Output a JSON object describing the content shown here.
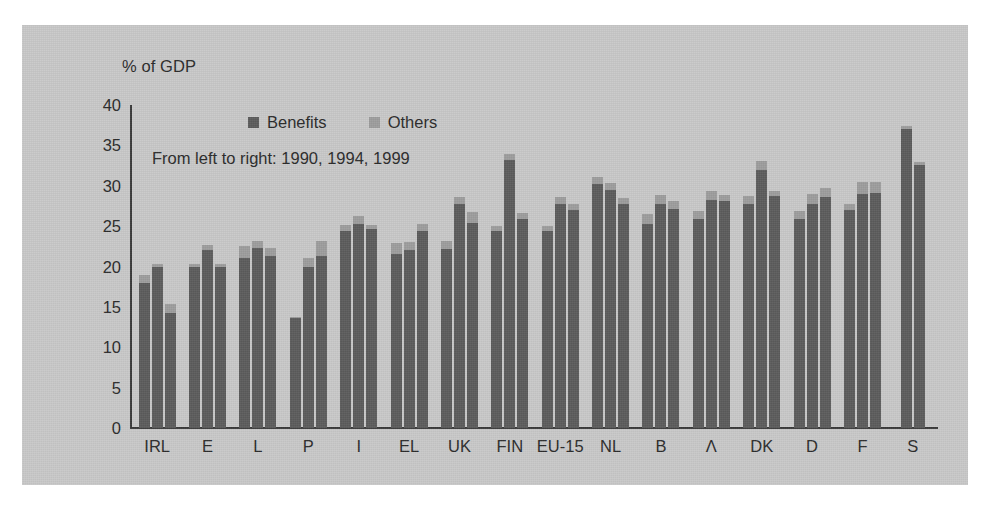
{
  "chart_data": {
    "type": "bar",
    "title": "",
    "subtitle": "",
    "axis_title": "% of GDP",
    "annotation": "From left to right: 1990, 1994, 1999",
    "xlabel": "",
    "ylabel": "% of GDP",
    "ylim": [
      0,
      40
    ],
    "yticks": [
      40,
      35,
      30,
      25,
      20,
      15,
      10,
      5,
      0
    ],
    "grid": false,
    "legend_position": "top-center",
    "stacked": true,
    "legend": [
      {
        "label": "Benefits",
        "color": "#5c5c5c"
      },
      {
        "label": "Others",
        "color": "#9d9d9d"
      }
    ],
    "series_order": [
      "1990",
      "1994",
      "1999"
    ],
    "categories": [
      "IRL",
      "E",
      "L",
      "P",
      "I",
      "EL",
      "UK",
      "FIN",
      "EU-15",
      "NL",
      "B",
      "Λ",
      "DK",
      "D",
      "F",
      "S"
    ],
    "groups": [
      {
        "category": "IRL",
        "bars": [
          {
            "year": "1990",
            "benefits": 17.9,
            "others": 1.0,
            "total": 18.9
          },
          {
            "year": "1994",
            "benefits": 19.9,
            "others": 0.4,
            "total": 20.3
          },
          {
            "year": "1999",
            "benefits": 14.3,
            "others": 1.1,
            "total": 15.4
          }
        ]
      },
      {
        "category": "E",
        "bars": [
          {
            "year": "1990",
            "benefits": 19.9,
            "others": 0.4,
            "total": 20.3
          },
          {
            "year": "1994",
            "benefits": 22.0,
            "others": 0.7,
            "total": 22.7
          },
          {
            "year": "1999",
            "benefits": 19.9,
            "others": 0.4,
            "total": 20.3
          }
        ]
      },
      {
        "category": "L",
        "bars": [
          {
            "year": "1990",
            "benefits": 21.1,
            "others": 1.4,
            "total": 22.5
          },
          {
            "year": "1994",
            "benefits": 22.3,
            "others": 0.9,
            "total": 23.2
          },
          {
            "year": "1999",
            "benefits": 21.3,
            "others": 1.0,
            "total": 22.3
          }
        ]
      },
      {
        "category": "P",
        "bars": [
          {
            "year": "1990",
            "benefits": 13.6,
            "others": 0.2,
            "total": 13.8
          },
          {
            "year": "1994",
            "benefits": 19.9,
            "others": 1.2,
            "total": 21.1
          },
          {
            "year": "1999",
            "benefits": 21.3,
            "others": 1.8,
            "total": 23.1
          }
        ]
      },
      {
        "category": "I",
        "bars": [
          {
            "year": "1990",
            "benefits": 24.4,
            "others": 0.8,
            "total": 25.2
          },
          {
            "year": "1994",
            "benefits": 25.3,
            "others": 0.9,
            "total": 26.2
          },
          {
            "year": "1999",
            "benefits": 24.6,
            "others": 0.6,
            "total": 25.2
          }
        ]
      },
      {
        "category": "EL",
        "bars": [
          {
            "year": "1990",
            "benefits": 21.6,
            "others": 1.3,
            "total": 22.9
          },
          {
            "year": "1994",
            "benefits": 22.1,
            "others": 0.9,
            "total": 23.0
          },
          {
            "year": "1999",
            "benefits": 24.4,
            "others": 0.9,
            "total": 25.3
          }
        ]
      },
      {
        "category": "UK",
        "bars": [
          {
            "year": "1990",
            "benefits": 22.2,
            "others": 0.9,
            "total": 23.1
          },
          {
            "year": "1994",
            "benefits": 27.8,
            "others": 0.8,
            "total": 28.6
          },
          {
            "year": "1999",
            "benefits": 25.4,
            "others": 1.3,
            "total": 26.7
          }
        ]
      },
      {
        "category": "FIN",
        "bars": [
          {
            "year": "1990",
            "benefits": 24.4,
            "others": 0.6,
            "total": 25.0
          },
          {
            "year": "1994",
            "benefits": 33.2,
            "others": 0.7,
            "total": 33.9
          },
          {
            "year": "1999",
            "benefits": 25.9,
            "others": 0.7,
            "total": 26.6
          }
        ]
      },
      {
        "category": "EU-15",
        "bars": [
          {
            "year": "1990",
            "benefits": 24.4,
            "others": 0.6,
            "total": 25.0
          },
          {
            "year": "1994",
            "benefits": 27.7,
            "others": 0.9,
            "total": 28.6
          },
          {
            "year": "1999",
            "benefits": 27.0,
            "others": 0.8,
            "total": 27.8
          }
        ]
      },
      {
        "category": "NL",
        "bars": [
          {
            "year": "1990",
            "benefits": 30.2,
            "others": 0.9,
            "total": 31.1
          },
          {
            "year": "1994",
            "benefits": 29.5,
            "others": 0.9,
            "total": 30.4
          },
          {
            "year": "1999",
            "benefits": 27.8,
            "others": 0.7,
            "total": 28.5
          }
        ]
      },
      {
        "category": "B",
        "bars": [
          {
            "year": "1990",
            "benefits": 25.3,
            "others": 1.2,
            "total": 26.5
          },
          {
            "year": "1994",
            "benefits": 27.8,
            "others": 1.1,
            "total": 28.9
          },
          {
            "year": "1999",
            "benefits": 27.1,
            "others": 1.0,
            "total": 28.1
          }
        ]
      },
      {
        "category": "Λ",
        "bars": [
          {
            "year": "1990",
            "benefits": 25.9,
            "others": 1.0,
            "total": 26.9
          },
          {
            "year": "1994",
            "benefits": 28.2,
            "others": 1.2,
            "total": 29.4
          },
          {
            "year": "1999",
            "benefits": 28.1,
            "others": 0.8,
            "total": 28.9
          }
        ]
      },
      {
        "category": "DK",
        "bars": [
          {
            "year": "1990",
            "benefits": 27.8,
            "others": 0.9,
            "total": 28.7
          },
          {
            "year": "1994",
            "benefits": 31.9,
            "others": 1.2,
            "total": 33.1
          },
          {
            "year": "1999",
            "benefits": 28.7,
            "others": 0.7,
            "total": 29.4
          }
        ]
      },
      {
        "category": "D",
        "bars": [
          {
            "year": "1990",
            "benefits": 25.9,
            "others": 1.0,
            "total": 26.9
          },
          {
            "year": "1994",
            "benefits": 27.8,
            "others": 1.2,
            "total": 29.0
          },
          {
            "year": "1999",
            "benefits": 28.6,
            "others": 1.1,
            "total": 29.7
          }
        ]
      },
      {
        "category": "F",
        "bars": [
          {
            "year": "1990",
            "benefits": 27.0,
            "others": 0.8,
            "total": 27.8
          },
          {
            "year": "1994",
            "benefits": 29.0,
            "others": 1.5,
            "total": 30.5
          },
          {
            "year": "1999",
            "benefits": 29.1,
            "others": 1.4,
            "total": 30.5
          }
        ]
      },
      {
        "category": "S",
        "bars": [
          {
            "year": "1990",
            "benefits": 37.0,
            "others": 0.4,
            "total": 37.4
          },
          {
            "year": "1994",
            "benefits": 32.6,
            "others": 0.4,
            "total": 33.0
          }
        ]
      }
    ]
  }
}
